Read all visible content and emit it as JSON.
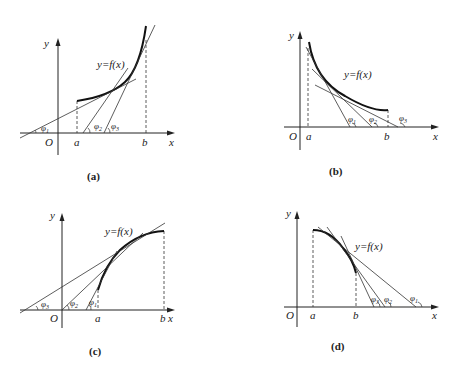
{
  "panels": [
    {
      "id": "a",
      "caption": "(a)",
      "curve_label": "y=f(x)",
      "axis_labels": {
        "x": "x",
        "y": "y",
        "origin": "O"
      },
      "points": [
        "a",
        "b"
      ],
      "angles": [
        {
          "symbol": "φ",
          "sub": "1"
        },
        {
          "symbol": "φ",
          "sub": "2"
        },
        {
          "symbol": "φ",
          "sub": "3"
        }
      ],
      "description": "Increasing, concave-up curve on [a,b]; tangent angles φ1 < φ2 < φ3 increase"
    },
    {
      "id": "b",
      "caption": "(b)",
      "curve_label": "y=f(x)",
      "axis_labels": {
        "x": "x",
        "y": "y",
        "origin": "O"
      },
      "points": [
        "a",
        "b"
      ],
      "angles": [
        {
          "symbol": "φ",
          "sub": "1"
        },
        {
          "symbol": "φ",
          "sub": "2"
        },
        {
          "symbol": "φ",
          "sub": "3"
        }
      ],
      "description": "Decreasing, concave-up curve on [a,b]; tangent angles increase"
    },
    {
      "id": "c",
      "caption": "(c)",
      "curve_label": "y=f(x)",
      "axis_labels": {
        "x": "x",
        "y": "y",
        "origin": "O"
      },
      "points": [
        "a",
        "b"
      ],
      "angles": [
        {
          "symbol": "φ",
          "sub": "3"
        },
        {
          "symbol": "φ",
          "sub": "2"
        },
        {
          "symbol": "φ",
          "sub": "1"
        }
      ],
      "description": "Increasing, concave-down curve on [a,b]; tangent angles decrease"
    },
    {
      "id": "d",
      "caption": "(d)",
      "curve_label": "y=f(x)",
      "axis_labels": {
        "x": "x",
        "y": "y",
        "origin": "O"
      },
      "points": [
        "a",
        "b"
      ],
      "angles": [
        {
          "symbol": "φ",
          "sub": "3"
        },
        {
          "symbol": "φ",
          "sub": "2"
        },
        {
          "symbol": "φ",
          "sub": "1"
        }
      ],
      "description": "Decreasing, concave-down curve on [a,b]; tangent angles decrease"
    }
  ]
}
